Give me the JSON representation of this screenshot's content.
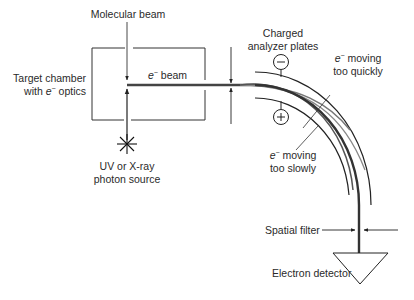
{
  "diagram": {
    "labels": {
      "molecular_beam": "Molecular beam",
      "target_chamber_line1": "Target chamber",
      "target_chamber_line2_prefix": "with ",
      "target_chamber_line2_e": "e",
      "target_chamber_line2_sup": "−",
      "target_chamber_line2_suffix": " optics",
      "e_beam_e": "e",
      "e_beam_sup": "−",
      "e_beam_suffix": " beam",
      "photon_source_line1": "UV or X-ray",
      "photon_source_line2": "photon source",
      "analyzer_plates_line1": "Charged",
      "analyzer_plates_line2": "analyzer plates",
      "too_quickly_e": "e",
      "too_quickly_sup": "−",
      "too_quickly_line1_suffix": " moving",
      "too_quickly_line2": "too quickly",
      "too_slowly_e": "e",
      "too_slowly_sup": "−",
      "too_slowly_line1_suffix": " moving",
      "too_slowly_line2": "too slowly",
      "spatial_filter": "Spatial filter",
      "electron_detector": "Electron detector",
      "negative_plate_symbol": "−",
      "positive_plate_symbol": "+"
    },
    "colors": {
      "line": "#222222",
      "beam": "#444444",
      "beam_light": "#888888",
      "text": "#2a2a2a"
    }
  }
}
